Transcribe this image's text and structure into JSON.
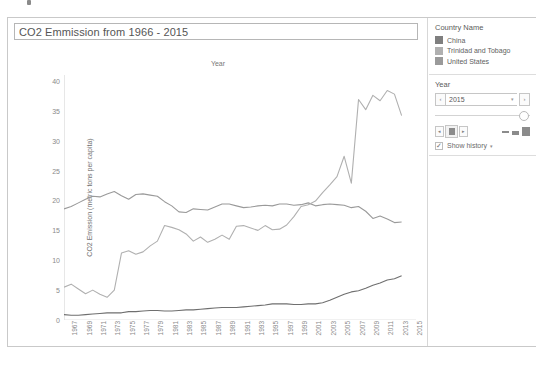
{
  "window": {
    "chart_title": "CO2 Emmission from 1966 - 2015"
  },
  "side_panel": {
    "legend": {
      "title": "Country Name",
      "items": [
        {
          "label": "China",
          "color": "#7f7f7f"
        },
        {
          "label": "Trinidad and Tobago",
          "color": "#b0b0b0"
        },
        {
          "label": "United States",
          "color": "#9a9a9a"
        }
      ]
    },
    "year_filter": {
      "title": "Year",
      "value": "2015",
      "prev_label": "‹",
      "next_label": "›",
      "caret": "▾",
      "play_prev": "◂",
      "play_next": "▸",
      "show_history_label": "Show history",
      "show_history_checked": true,
      "check_glyph": "✓",
      "history_caret": "▾"
    }
  },
  "chart_data": {
    "type": "line",
    "title": "CO2 Emmission from 1966 - 2015",
    "xlabel": "Year",
    "ylabel": "CO2 Emission (metric tons per capita)",
    "xlim": [
      1966,
      2015
    ],
    "ylim": [
      0,
      41
    ],
    "yticks": [
      0,
      5,
      10,
      15,
      20,
      25,
      30,
      35,
      40
    ],
    "xticks": [
      1967,
      1969,
      1971,
      1973,
      1975,
      1977,
      1979,
      1981,
      1983,
      1985,
      1987,
      1989,
      1991,
      1993,
      1995,
      1997,
      1999,
      2001,
      2003,
      2005,
      2007,
      2009,
      2011,
      2013,
      2015
    ],
    "grid": false,
    "legend_position": "right",
    "x": [
      1966,
      1967,
      1968,
      1969,
      1970,
      1971,
      1972,
      1973,
      1974,
      1975,
      1976,
      1977,
      1978,
      1979,
      1980,
      1981,
      1982,
      1983,
      1984,
      1985,
      1986,
      1987,
      1988,
      1989,
      1990,
      1991,
      1992,
      1993,
      1994,
      1995,
      1996,
      1997,
      1998,
      1999,
      2000,
      2001,
      2002,
      2003,
      2004,
      2005,
      2006,
      2007,
      2008,
      2009,
      2010,
      2011,
      2012,
      2013
    ],
    "series": [
      {
        "name": "United States",
        "color": "#9a9a9a",
        "values": [
          18.6,
          19.0,
          19.6,
          20.2,
          20.7,
          20.6,
          21.1,
          21.5,
          20.8,
          20.2,
          21.0,
          21.1,
          20.9,
          20.7,
          19.8,
          19.1,
          18.1,
          18.0,
          18.6,
          18.5,
          18.4,
          18.9,
          19.4,
          19.4,
          19.1,
          18.8,
          18.9,
          19.1,
          19.2,
          19.1,
          19.4,
          19.4,
          19.2,
          19.3,
          19.6,
          19.1,
          19.3,
          19.4,
          19.3,
          19.2,
          18.8,
          19.0,
          18.2,
          17.0,
          17.4,
          16.9,
          16.3,
          16.4
        ]
      },
      {
        "name": "Trinidad and Tobago",
        "color": "#b0b0b0",
        "values": [
          5.5,
          6.0,
          5.2,
          4.4,
          5.0,
          4.3,
          3.8,
          5.0,
          11.2,
          11.6,
          11.0,
          11.4,
          12.4,
          13.2,
          15.8,
          15.5,
          15.1,
          14.4,
          13.2,
          13.9,
          13.0,
          13.5,
          14.2,
          13.5,
          15.7,
          15.8,
          15.4,
          15.0,
          15.8,
          15.1,
          15.2,
          15.9,
          17.3,
          19.0,
          19.3,
          19.9,
          21.3,
          22.6,
          24.0,
          27.4,
          22.9,
          36.9,
          35.2,
          37.6,
          36.7,
          38.4,
          37.8,
          34.2
        ]
      },
      {
        "name": "China",
        "color": "#6f6f6f",
        "values": [
          0.9,
          0.8,
          0.8,
          0.9,
          1.0,
          1.1,
          1.2,
          1.2,
          1.2,
          1.4,
          1.4,
          1.5,
          1.6,
          1.6,
          1.5,
          1.5,
          1.6,
          1.7,
          1.7,
          1.8,
          1.9,
          2.0,
          2.1,
          2.1,
          2.1,
          2.2,
          2.3,
          2.4,
          2.5,
          2.7,
          2.7,
          2.7,
          2.6,
          2.6,
          2.7,
          2.7,
          2.9,
          3.3,
          3.8,
          4.3,
          4.7,
          4.9,
          5.3,
          5.8,
          6.2,
          6.7,
          6.9,
          7.4
        ]
      }
    ]
  }
}
